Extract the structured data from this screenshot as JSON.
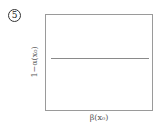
{
  "panel": {
    "label": "5"
  },
  "chart_data": {
    "type": "line",
    "title": "",
    "xlabel": "β(x₀)",
    "ylabel": "1−α(x₀)",
    "xlim": [
      0,
      1
    ],
    "ylim": [
      0,
      1
    ],
    "grid": false,
    "ticks": "none",
    "series": [
      {
        "name": "constant",
        "x": [
          0.05,
          0.97
        ],
        "y": [
          0.55,
          0.55
        ]
      }
    ]
  }
}
